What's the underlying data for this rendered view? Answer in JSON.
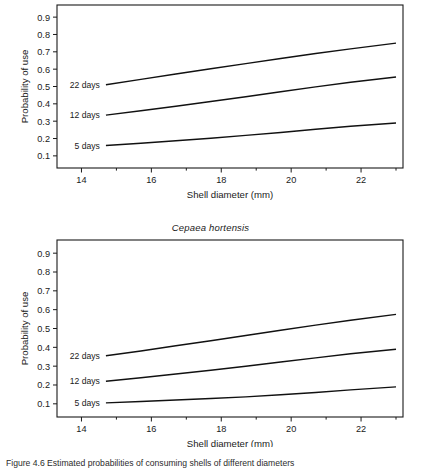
{
  "figure": {
    "background": "#ffffff",
    "ink_color": "#111111",
    "caption_fragment": "Figure 4.6   Estimated probabilities of consuming shells of different diameters"
  },
  "chart_data": [
    {
      "id": "panel-top",
      "type": "line",
      "title": "",
      "xlabel": "Shell diameter (mm)",
      "ylabel": "Probability of use",
      "xlim": [
        13.3,
        23.2
      ],
      "ylim": [
        0.03,
        0.97
      ],
      "xticks": [
        14,
        16,
        18,
        20,
        22
      ],
      "xticklabels": [
        "14",
        "16",
        "18",
        "20",
        "22"
      ],
      "xminorticks": [
        15,
        17,
        19,
        21,
        23
      ],
      "yticks": [
        0.1,
        0.2,
        0.3,
        0.4,
        0.5,
        0.6,
        0.7,
        0.8,
        0.9
      ],
      "yticklabels": [
        "0.1",
        "0.2",
        "0.3",
        "0.4",
        "0.5",
        "0.6",
        "0.7",
        "0.8",
        "0.9"
      ],
      "grid": false,
      "legend_position": "inline-left",
      "x": [
        14.7,
        15.7,
        16.7,
        17.7,
        18.7,
        19.7,
        20.7,
        21.7,
        23.0
      ],
      "series": [
        {
          "name": "22 days",
          "label": "22 days",
          "label_x": 14.7,
          "label_y": 0.51,
          "values": [
            0.51,
            0.541,
            0.572,
            0.602,
            0.632,
            0.662,
            0.69,
            0.717,
            0.75
          ]
        },
        {
          "name": "12 days",
          "label": "12 days",
          "label_x": 14.7,
          "label_y": 0.335,
          "values": [
            0.335,
            0.36,
            0.386,
            0.413,
            0.441,
            0.47,
            0.498,
            0.525,
            0.555
          ]
        },
        {
          "name": "5 days",
          "label": "5 days",
          "label_x": 14.7,
          "label_y": 0.16,
          "values": [
            0.16,
            0.173,
            0.187,
            0.202,
            0.218,
            0.235,
            0.253,
            0.271,
            0.29
          ]
        }
      ]
    },
    {
      "id": "panel-bottom",
      "type": "line",
      "title": "Cepaea hortensis",
      "xlabel": "Shell diameter (mm)",
      "ylabel": "Probability of use",
      "xlim": [
        13.3,
        23.2
      ],
      "ylim": [
        0.03,
        0.97
      ],
      "xticks": [
        14,
        16,
        18,
        20,
        22
      ],
      "xticklabels": [
        "14",
        "16",
        "18",
        "20",
        "22"
      ],
      "xminorticks": [
        15,
        17,
        19,
        21,
        23
      ],
      "yticks": [
        0.1,
        0.2,
        0.3,
        0.4,
        0.5,
        0.6,
        0.7,
        0.8,
        0.9
      ],
      "yticklabels": [
        "0.1",
        "0.2",
        "0.3",
        "0.4",
        "0.5",
        "0.6",
        "0.7",
        "0.8",
        "0.9"
      ],
      "grid": false,
      "legend_position": "inline-left",
      "x": [
        14.7,
        15.7,
        16.7,
        17.7,
        18.7,
        19.7,
        20.7,
        21.7,
        23.0
      ],
      "series": [
        {
          "name": "22 days",
          "label": "22 days",
          "label_x": 14.7,
          "label_y": 0.355,
          "values": [
            0.355,
            0.381,
            0.408,
            0.435,
            0.463,
            0.491,
            0.518,
            0.544,
            0.575
          ]
        },
        {
          "name": "12 days",
          "label": "12 days",
          "label_x": 14.7,
          "label_y": 0.22,
          "values": [
            0.22,
            0.238,
            0.258,
            0.278,
            0.3,
            0.322,
            0.344,
            0.366,
            0.39
          ]
        },
        {
          "name": "5 days",
          "label": "5 days",
          "label_x": 14.7,
          "label_y": 0.105,
          "values": [
            0.105,
            0.112,
            0.12,
            0.128,
            0.137,
            0.148,
            0.16,
            0.174,
            0.19
          ]
        }
      ]
    }
  ]
}
